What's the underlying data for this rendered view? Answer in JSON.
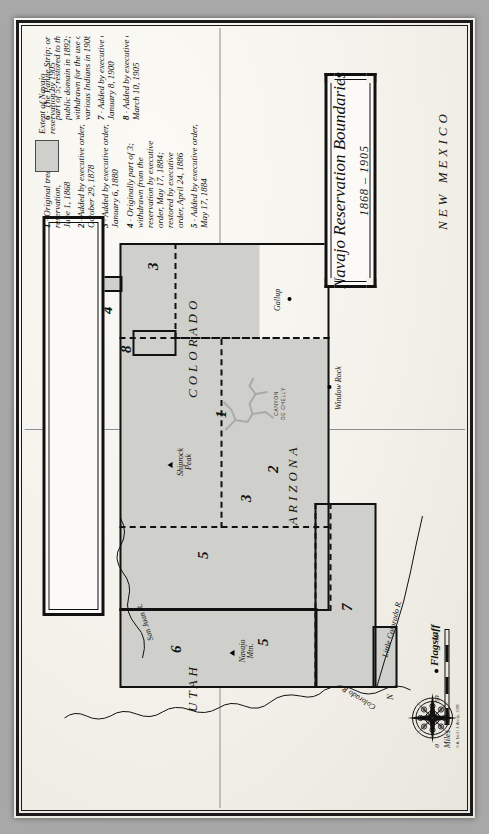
{
  "document": {
    "kind": "historical-map",
    "title_main": "Navajo Reservation Boundaries",
    "title_sub": "1868 – 1905",
    "credit": "© A. Neil / J. Alsup, 1985"
  },
  "legend": {
    "swatch_label_line1": "Extent of Navajo",
    "swatch_label_line2": "reservation by 1905",
    "swatch_color": "#cfcfcb",
    "entries": [
      {
        "num": "1",
        "lines": [
          "Original treaty reservation,",
          "June 1, 1868"
        ]
      },
      {
        "num": "2",
        "lines": [
          "Added by executive order,",
          "October 29, 1878"
        ]
      },
      {
        "num": "3",
        "lines": [
          "Added by executive order,",
          "January 6, 1880"
        ]
      },
      {
        "num": "4",
        "lines": [
          "Originally part of 3;",
          "withdrawn from the",
          "reservation by executive",
          "order, May 17, 1884;",
          "restored by executive",
          "order, April 24, 1886"
        ]
      },
      {
        "num": "5",
        "lines": [
          "Added by executive order,",
          "May 17, 1884"
        ]
      },
      {
        "num": "6",
        "lines": [
          "The Paiute Strip; originally",
          "part of 5; restored to the",
          "public domain in 1892;",
          "withdrawn for the use of",
          "various Indians in 1908"
        ]
      },
      {
        "num": "7",
        "lines": [
          "Added by executive order,",
          "January 8, 1900"
        ]
      },
      {
        "num": "8",
        "lines": [
          "Added by executive order,",
          "March 10, 1905"
        ]
      }
    ]
  },
  "states": [
    {
      "name": "UTAH"
    },
    {
      "name": "COLORADO"
    },
    {
      "name": "ARIZONA"
    },
    {
      "name": "NEW MEXICO"
    }
  ],
  "regions": [
    {
      "num": "1"
    },
    {
      "num": "2"
    },
    {
      "num": "3"
    },
    {
      "num": "3"
    },
    {
      "num": "4"
    },
    {
      "num": "5"
    },
    {
      "num": "5"
    },
    {
      "num": "6"
    },
    {
      "num": "7"
    },
    {
      "num": "8"
    }
  ],
  "places": [
    {
      "name": "Shiprock Peak",
      "marker": "mountain-triangle"
    },
    {
      "name": "Navajo Mtn.",
      "marker": "mountain-triangle"
    },
    {
      "name": "Window Rock",
      "marker": "town-dot"
    },
    {
      "name": "Gallup",
      "marker": "town-dot"
    },
    {
      "name": "Flagstaff",
      "marker": "town-dot"
    }
  ],
  "hydrography": [
    {
      "name": "San Juan R."
    },
    {
      "name": "Colorado R."
    },
    {
      "name": "Little Colorado R."
    }
  ],
  "features": [
    {
      "name_line1": "CANYON",
      "name_line2": "DE CHELLY"
    }
  ],
  "scale": {
    "unit_label": "Miles",
    "ticks": [
      "0",
      "50",
      "50"
    ]
  },
  "compass": {
    "north_label": "N",
    "icon": "compass-rose"
  }
}
